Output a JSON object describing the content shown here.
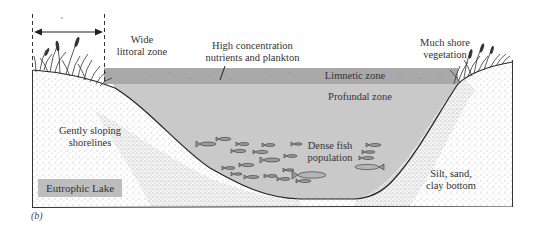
{
  "diagram": {
    "title": "Eutrophic Lake",
    "caption": "(b)",
    "colors": {
      "limnetic_band": "#a9a9a9",
      "profundal_water": "#c9c9c9",
      "legend_box": "#bdbdbd",
      "shore_stipple": "#555555",
      "outline": "#222222"
    },
    "labels": {
      "littoral": [
        "Wide",
        "littoral zone"
      ],
      "nutrients": [
        "High concentration",
        "nutrients and plankton"
      ],
      "shore_vegetation": [
        "Much shore",
        "vegetation"
      ],
      "limnetic": "Limnetic zone",
      "profundal": "Profundal  zone",
      "shorelines": [
        "Gently sloping",
        "shorelines"
      ],
      "fish": [
        "Dense fish",
        "population"
      ],
      "bottom": [
        "Silt, sand,",
        "clay bottom"
      ]
    },
    "littoral_width_marker": {
      "type": "double-arrow",
      "between": "dashed lines at left shore"
    }
  }
}
